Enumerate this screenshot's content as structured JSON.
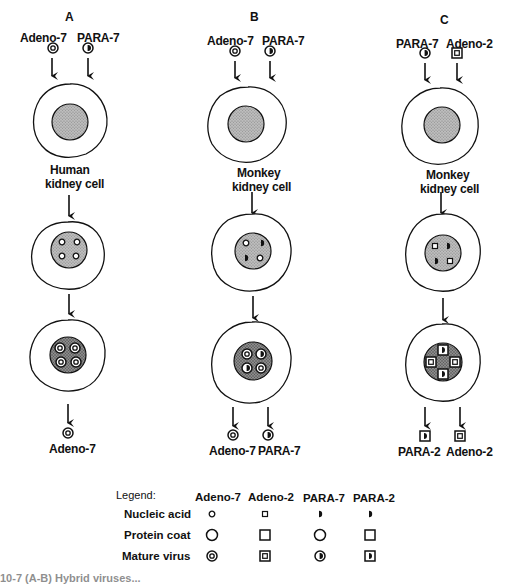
{
  "panels": [
    {
      "letter": "A",
      "inputs": [
        "Adeno-7",
        "PARA-7"
      ],
      "cell_label_1": "Human",
      "cell_label_2": "kidney cell",
      "outputs": [
        "Adeno-7"
      ]
    },
    {
      "letter": "B",
      "inputs": [
        "Adeno-7",
        "PARA-7"
      ],
      "cell_label_1": "Monkey",
      "cell_label_2": "kidney cell",
      "outputs": [
        "Adeno-7",
        "PARA-7"
      ]
    },
    {
      "letter": "C",
      "inputs": [
        "PARA-7",
        "Adeno-2"
      ],
      "cell_label_1": "Monkey",
      "cell_label_2": "kidney cell",
      "outputs": [
        "PARA-2",
        "Adeno-2"
      ]
    }
  ],
  "legend": {
    "title": "Legend:",
    "columns": [
      "Adeno-7",
      "Adeno-2",
      "PARA-7",
      "PARA-2"
    ],
    "rows": [
      "Nucleic acid",
      "Protein coat",
      "Mature virus"
    ]
  },
  "caption": "10-7 (A-B) Hybrid viruses..."
}
